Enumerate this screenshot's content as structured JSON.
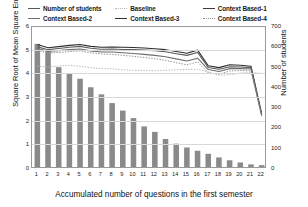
{
  "chart_data": {
    "type": "bar",
    "title": "",
    "xlabel": "Accumulated number of questions in the first semester",
    "ylabel": "Square Root of Mean Square Error",
    "ylabel_right": "Number of students",
    "categories": [
      "1",
      "2",
      "3",
      "4",
      "5",
      "6",
      "7",
      "8",
      "9",
      "10",
      "11",
      "12",
      "13",
      "14",
      "15",
      "16",
      "17",
      "18",
      "19",
      "20",
      "21",
      "22"
    ],
    "x": [
      1,
      2,
      3,
      4,
      5,
      6,
      7,
      8,
      9,
      10,
      11,
      12,
      13,
      14,
      15,
      16,
      17,
      18,
      19,
      20,
      21,
      22
    ],
    "ylim": [
      0,
      6
    ],
    "yticks": [
      0,
      1,
      2,
      3,
      4,
      5,
      6
    ],
    "ylim_right": [
      0,
      700
    ],
    "yticks_right": [
      0,
      100,
      200,
      300,
      400,
      500,
      600,
      700
    ],
    "grid": true,
    "legend_position": "top",
    "series": [
      {
        "name": "Number of students",
        "kind": "bar",
        "axis": "right",
        "color": "#8a8a8a",
        "values": [
          612,
          580,
          497,
          466,
          440,
          398,
          363,
          320,
          283,
          246,
          205,
          178,
          143,
          120,
          101,
          85,
          70,
          52,
          38,
          27,
          18,
          14
        ]
      },
      {
        "name": "Baseline",
        "kind": "line",
        "axis": "left",
        "style": "dotted",
        "color": "#b8b8b8",
        "values": [
          4.3,
          4.27,
          4.31,
          4.34,
          4.3,
          4.24,
          4.2,
          4.19,
          4.15,
          4.13,
          4.12,
          4.11,
          4.13,
          4.15,
          4.16,
          4.17,
          4.06,
          3.92,
          3.94,
          4.01,
          4.03,
          4.0
        ]
      },
      {
        "name": "Context Based-1",
        "kind": "line",
        "axis": "left",
        "style": "solid",
        "color": "#2e2e2e",
        "values": [
          5.22,
          5.08,
          5.13,
          5.18,
          5.22,
          5.14,
          5.1,
          5.11,
          5.1,
          5.09,
          5.07,
          5.04,
          5.0,
          4.92,
          4.85,
          4.98,
          4.32,
          4.24,
          4.36,
          4.34,
          4.3,
          2.3
        ]
      },
      {
        "name": "Context Based-2",
        "kind": "line",
        "axis": "left",
        "style": "solid",
        "color": "#5a5a5a",
        "values": [
          5.12,
          5.0,
          5.05,
          5.1,
          5.14,
          5.06,
          5.02,
          5.03,
          5.01,
          5.0,
          4.98,
          4.96,
          4.91,
          4.83,
          4.76,
          4.88,
          4.25,
          4.17,
          4.28,
          4.27,
          4.24,
          2.26
        ]
      },
      {
        "name": "Context Based-3",
        "kind": "line",
        "axis": "left",
        "style": "solid",
        "color": "#6e6e6e",
        "values": [
          5.06,
          4.93,
          4.96,
          5.0,
          5.03,
          4.95,
          4.9,
          4.9,
          4.87,
          4.84,
          4.8,
          4.76,
          4.7,
          4.61,
          4.52,
          4.64,
          4.16,
          4.08,
          4.2,
          4.2,
          4.18,
          2.22
        ]
      },
      {
        "name": "Context Based-4",
        "kind": "line",
        "axis": "left",
        "style": "dotted",
        "color": "#8f8f8f",
        "values": [
          4.98,
          4.86,
          4.88,
          4.92,
          4.95,
          4.87,
          4.82,
          4.8,
          4.76,
          4.72,
          4.67,
          4.62,
          4.55,
          4.45,
          4.36,
          4.48,
          4.02,
          3.96,
          4.1,
          4.12,
          4.1,
          2.18
        ]
      }
    ]
  },
  "legend": {
    "items": [
      {
        "label": "Number of students",
        "swatch": "sw-solid-mid"
      },
      {
        "label": "Baseline",
        "swatch": "sw-dot-light"
      },
      {
        "label": "Context Based-1",
        "swatch": "sw-solid-dark"
      },
      {
        "label": "Context Based-2",
        "swatch": "sw-solid-grey"
      },
      {
        "label": "Context Based-3",
        "swatch": "sw-solid-dark2"
      },
      {
        "label": "Context Based-4",
        "swatch": "sw-dot-mid"
      }
    ]
  }
}
